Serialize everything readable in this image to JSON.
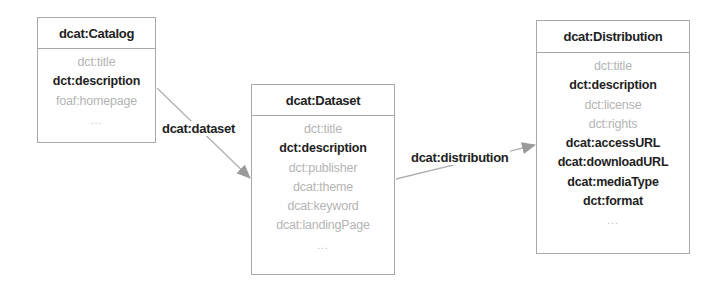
{
  "diagram": {
    "nodes": [
      {
        "id": "catalog",
        "title": "dcat:Catalog",
        "properties": [
          {
            "label": "dct:title",
            "style": "gray"
          },
          {
            "label": "dct:description",
            "style": "bold"
          },
          {
            "label": "foaf:homepage",
            "style": "gray"
          },
          {
            "label": "...",
            "style": "ellipsis"
          }
        ]
      },
      {
        "id": "dataset",
        "title": "dcat:Dataset",
        "properties": [
          {
            "label": "dct:title",
            "style": "gray"
          },
          {
            "label": "dct:description",
            "style": "bold"
          },
          {
            "label": "dct:publisher",
            "style": "gray"
          },
          {
            "label": "dcat:theme",
            "style": "gray"
          },
          {
            "label": "dcat:keyword",
            "style": "gray"
          },
          {
            "label": "dcat:landingPage",
            "style": "gray"
          },
          {
            "label": "...",
            "style": "ellipsis"
          }
        ]
      },
      {
        "id": "distribution",
        "title": "dcat:Distribution",
        "properties": [
          {
            "label": "dct:title",
            "style": "gray"
          },
          {
            "label": "dct:description",
            "style": "bold"
          },
          {
            "label": "dct:license",
            "style": "gray"
          },
          {
            "label": "dct:rights",
            "style": "gray"
          },
          {
            "label": "dcat:accessURL",
            "style": "bold"
          },
          {
            "label": "dcat:downloadURL",
            "style": "bold"
          },
          {
            "label": "dcat:mediaType",
            "style": "bold"
          },
          {
            "label": "dct:format",
            "style": "bold"
          },
          {
            "label": "...",
            "style": "ellipsis"
          }
        ]
      }
    ],
    "edges": [
      {
        "from": "catalog",
        "to": "dataset",
        "label": "dcat:dataset"
      },
      {
        "from": "dataset",
        "to": "distribution",
        "label": "dcat:distribution"
      }
    ],
    "colors": {
      "border": "#a8a8a8",
      "bold_text": "#1e1e1e",
      "gray_text": "#b4b4b4",
      "arrow": "#a0a0a0"
    }
  }
}
